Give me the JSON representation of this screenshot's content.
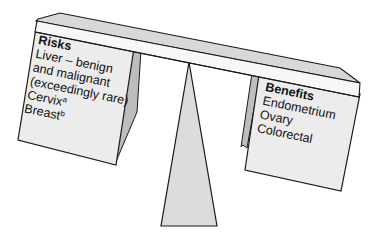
{
  "risks": {
    "title": "Risks",
    "lines": [
      {
        "text": "Liver – benign"
      },
      {
        "text": "and malignant"
      },
      {
        "text": "(exceedingly rare)"
      },
      {
        "text": "Cervix",
        "sup": "a"
      },
      {
        "text": "Breast",
        "sup": "b"
      }
    ]
  },
  "benefits": {
    "title": "Benefits",
    "lines": [
      {
        "text": "Endometrium"
      },
      {
        "text": "Ovary"
      },
      {
        "text": "Colorectal"
      }
    ]
  },
  "colors": {
    "box_face": "#ececec",
    "box_side": "#bdbdbd",
    "beam_top": "#d8d8d8",
    "beam_front": "#f4f4f4",
    "fulcrum": "#dcdcdc",
    "outline": "#1a1a1a"
  }
}
